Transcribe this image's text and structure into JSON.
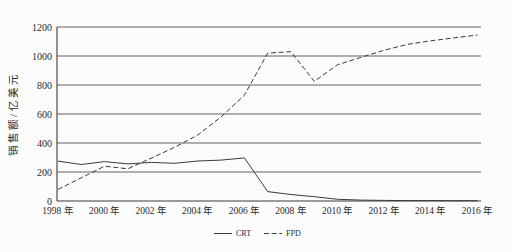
{
  "figure": {
    "background": "#fcfcfc",
    "ink": "#3a3a3a",
    "text_color": "#2b2b2b"
  },
  "chart_data": {
    "type": "line",
    "title": "",
    "xlabel": "",
    "ylabel": "销售额/亿美元",
    "ylim": [
      0,
      1200
    ],
    "yticks": [
      0,
      200,
      400,
      600,
      800,
      1000,
      1200
    ],
    "grid": "horizontal",
    "legend_position": "bottom-center",
    "x": [
      1998,
      1999,
      2000,
      2001,
      2002,
      2003,
      2004,
      2005,
      2006,
      2007,
      2008,
      2009,
      2010,
      2011,
      2012,
      2013,
      2014,
      2015,
      2016
    ],
    "xtick_labels": [
      "1998 年",
      "2000 年",
      "2002 年",
      "2004 年",
      "2006 年",
      "2008 年",
      "2010 年",
      "2012 年",
      "2014 年",
      "2016 年"
    ],
    "xtick_years": [
      1998,
      2000,
      2002,
      2004,
      2006,
      2008,
      2010,
      2012,
      2014,
      2016
    ],
    "series": [
      {
        "name": "CRT",
        "style": "solid",
        "color": "#3a3a3a",
        "values": [
          275,
          252,
          272,
          256,
          266,
          260,
          276,
          282,
          297,
          65,
          45,
          30,
          12,
          6,
          4,
          3,
          3,
          2,
          2
        ]
      },
      {
        "name": "FPD",
        "style": "dashed",
        "color": "#3a3a3a",
        "values": [
          80,
          160,
          240,
          222,
          295,
          370,
          455,
          580,
          730,
          1020,
          1030,
          825,
          940,
          990,
          1040,
          1080,
          1105,
          1125,
          1145
        ]
      }
    ]
  }
}
